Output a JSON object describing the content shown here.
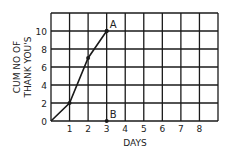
{
  "chart_data": {
    "type": "line",
    "title": "",
    "xlabel": "DAYS",
    "ylabel_lines": [
      "CUM NO OF",
      "THANK YOU'S"
    ],
    "ylabel": "CUM NO OF THANK YOU'S",
    "x_ticks": [
      1,
      2,
      3,
      4,
      5,
      6,
      7,
      8
    ],
    "y_ticks": [
      0,
      2,
      4,
      6,
      8,
      10
    ],
    "xlim": [
      0,
      9
    ],
    "ylim": [
      0,
      12
    ],
    "grid": true,
    "series": [
      {
        "name": "cumulative",
        "x": [
          0,
          1,
          2,
          3
        ],
        "values": [
          0,
          2,
          7,
          10
        ]
      }
    ],
    "annotations": [
      {
        "label": "A",
        "x": 3,
        "y": 10
      },
      {
        "label": "B",
        "x": 3,
        "y": 0
      }
    ]
  },
  "colors": {
    "line": "#1a1a1a",
    "grid": "#1a1a1a",
    "text": "#222222"
  }
}
